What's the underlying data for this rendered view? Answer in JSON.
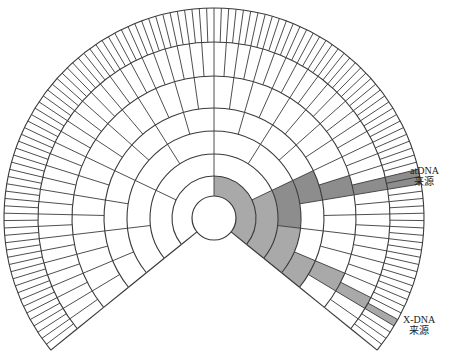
{
  "diagram": {
    "type": "fan-pedigree-chart",
    "center": [
      214,
      218
    ],
    "span_deg": [
      219,
      -39
    ],
    "ring_radii": [
      22,
      42,
      64,
      87,
      110,
      142,
      176,
      210
    ],
    "ring_cell_counts": [
      2,
      4,
      8,
      16,
      32,
      64,
      128
    ],
    "colors": {
      "line": "#3a3a3a",
      "medium_shade": "#a9a9a9",
      "dark_shade": "#8d8d8d",
      "background": "#ffffff"
    },
    "shaded_cells": [
      {
        "ring": 1,
        "from": 90,
        "to": -39,
        "shade": "medium_shade",
        "path": "x-dna"
      },
      {
        "ring": 2,
        "from": 25.5,
        "to": -39,
        "shade": "medium_shade",
        "path": "x-dna"
      },
      {
        "ring": 3,
        "from": 25.5,
        "to": -6.75,
        "shade": "dark_shade",
        "path": "atdna"
      },
      {
        "ring": 3,
        "from": -6.75,
        "to": -39,
        "shade": "medium_shade",
        "path": "x-dna"
      },
      {
        "ring": 4,
        "from": 25.5,
        "to": 9.375,
        "shade": "dark_shade",
        "path": "atdna"
      },
      {
        "ring": 4,
        "from": -22.875,
        "to": -39,
        "shade": "medium_shade",
        "path": "x-dna"
      },
      {
        "ring": 5,
        "from": 17.44,
        "to": 9.375,
        "shade": "dark_shade",
        "path": "atdna"
      },
      {
        "ring": 5,
        "from": -22.875,
        "to": -30.94,
        "shade": "medium_shade",
        "path": "x-dna"
      },
      {
        "ring": 6,
        "from": 13.41,
        "to": 9.375,
        "shade": "dark_shade",
        "path": "atdna"
      },
      {
        "ring": 6,
        "from": -26.9,
        "to": -30.94,
        "shade": "medium_shade",
        "path": "x-dna"
      },
      {
        "ring": 7,
        "from": 13.41,
        "to": 9.375,
        "shade": "dark_shade",
        "path": "atdna"
      },
      {
        "ring": 7,
        "from": -28.92,
        "to": -30.94,
        "shade": "medium_shade",
        "path": "x-dna"
      }
    ]
  },
  "labels": {
    "atdna": {
      "line1": "atDNA",
      "line2": "来源"
    },
    "xdna": {
      "line1": "X-DNA",
      "line2": "来源"
    }
  }
}
